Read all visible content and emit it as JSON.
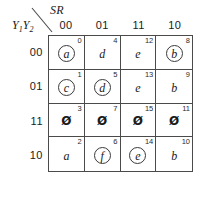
{
  "diagram": {
    "type": "karnaugh-map",
    "column_variable_label": "SR",
    "row_variable_label_prefix": "Y",
    "row_variable_sub1": "1",
    "row_variable_sub2": "2",
    "column_headers": [
      "00",
      "01",
      "11",
      "10"
    ],
    "row_headers": [
      "00",
      "01",
      "11",
      "10"
    ],
    "cells": [
      {
        "index": "0",
        "value": "a",
        "circled": true,
        "dontcare": false
      },
      {
        "index": "4",
        "value": "d",
        "circled": false,
        "dontcare": false
      },
      {
        "index": "12",
        "value": "e",
        "circled": false,
        "dontcare": false
      },
      {
        "index": "8",
        "value": "b",
        "circled": true,
        "dontcare": false
      },
      {
        "index": "1",
        "value": "c",
        "circled": true,
        "dontcare": false
      },
      {
        "index": "5",
        "value": "d",
        "circled": true,
        "dontcare": false
      },
      {
        "index": "13",
        "value": "e",
        "circled": false,
        "dontcare": false
      },
      {
        "index": "9",
        "value": "b",
        "circled": false,
        "dontcare": false
      },
      {
        "index": "3",
        "value": "Ø",
        "circled": false,
        "dontcare": true
      },
      {
        "index": "7",
        "value": "Ø",
        "circled": false,
        "dontcare": true
      },
      {
        "index": "15",
        "value": "Ø",
        "circled": false,
        "dontcare": true
      },
      {
        "index": "11",
        "value": "Ø",
        "circled": false,
        "dontcare": true
      },
      {
        "index": "2",
        "value": "a",
        "circled": false,
        "dontcare": false
      },
      {
        "index": "6",
        "value": "f",
        "circled": true,
        "dontcare": false
      },
      {
        "index": "14",
        "value": "e",
        "circled": true,
        "dontcare": false
      },
      {
        "index": "10",
        "value": "b",
        "circled": false,
        "dontcare": false
      }
    ],
    "colors": {
      "line": "#4a4a4a",
      "text": "#1a1a1a",
      "background": "#ffffff"
    }
  }
}
